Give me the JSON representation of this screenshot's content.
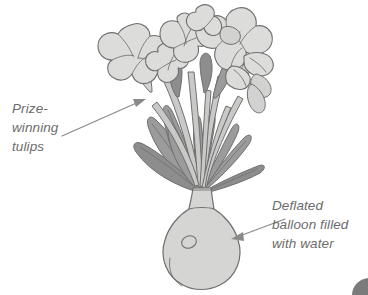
{
  "figure": {
    "type": "line-drawing-illustration",
    "background_color": "#ffffff",
    "outline_color": "#6f6f6f",
    "petal_fill": "#dcdcda",
    "leaf_fill": "#9b9b9b",
    "stem_fill": "#c9c9c7",
    "vase_fill": "#d5d5d3",
    "text_color": "#6c6c6c",
    "arrow_color": "#8a8a8a"
  },
  "callouts": [
    {
      "id": "prize-winning-tulips",
      "lines": [
        "Prize-",
        "winning",
        "tulips"
      ],
      "arrow": {
        "from_x": 62,
        "from_y": 136,
        "to_x": 145,
        "to_y": 99
      }
    },
    {
      "id": "deflated-balloon",
      "lines": [
        "Deflated",
        "balloon filled",
        "with water"
      ],
      "arrow": {
        "from_x": 285,
        "from_y": 219,
        "to_x": 232,
        "to_y": 239
      }
    }
  ],
  "corner_mark": {
    "name": "page-corner-mark",
    "color": "#7b7b7b"
  }
}
